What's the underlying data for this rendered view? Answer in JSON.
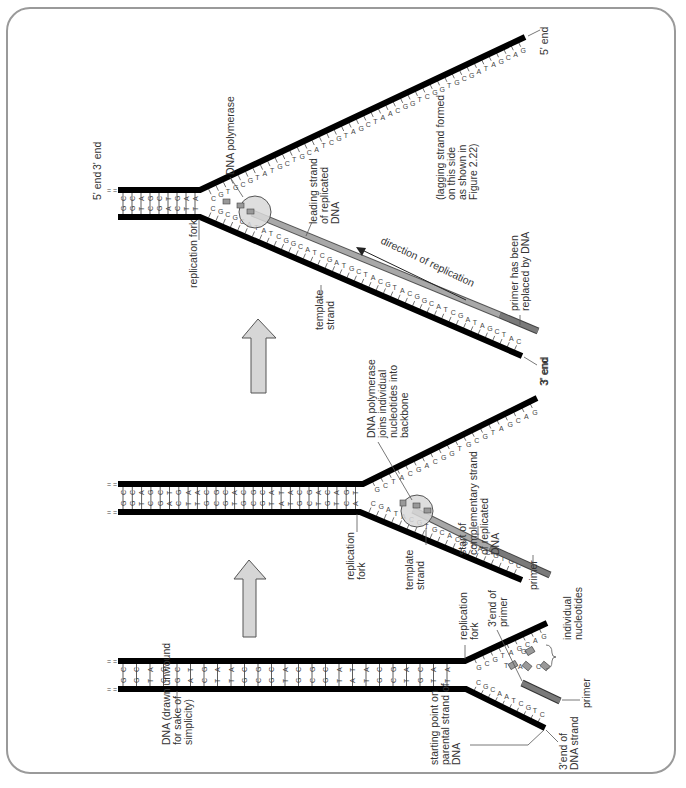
{
  "figure": {
    "orientation": "rotated-90-ccw",
    "colors": {
      "backbone": "#000000",
      "new_strand": "#a8a8a8",
      "primer": "#7a7a7a",
      "polymerase": "#d8d8d8",
      "step_arrow": "#d6d6d6",
      "frame": "#9a9a9a"
    },
    "panels": [
      {
        "id": "panel-1",
        "step": 1,
        "base_pairs": [
          "CG",
          "CG",
          "AT",
          "GC",
          "CG",
          "TA",
          "GC",
          "AT",
          "AT",
          "CG",
          "GC",
          "CG",
          "AT",
          "CG",
          "GC",
          "CG",
          "AT",
          "TA",
          "AT",
          "CG",
          "GC",
          "AT",
          "CG",
          "AT",
          "AT"
        ],
        "upper_arm_bases": [
          "G",
          "C",
          "G",
          "T",
          "A",
          "G",
          "C",
          "A",
          "G"
        ],
        "lower_arm_bases": [
          "C",
          "G",
          "C",
          "A",
          "A",
          "T",
          "C",
          "G",
          "T",
          "C"
        ],
        "free_nucleotides": [
          "T",
          "A",
          "G",
          "C"
        ],
        "labels": {
          "dna": "DNA (drawn unwound for sake of simplicity)",
          "starting_point": "starting point on parental strand of DNA",
          "fork": "replication fork",
          "primer_end": "3'end of primer",
          "nucleotides": "individual nucleotides",
          "primer": "primer",
          "strand_end": "3'end of DNA strand"
        }
      },
      {
        "id": "panel-2",
        "step": 2,
        "base_pairs": [
          "CG",
          "CG",
          "AT",
          "GC",
          "CG",
          "TA",
          "GC",
          "AT",
          "AT",
          "CG",
          "GC",
          "CG",
          "AT",
          "CG",
          "GC",
          "CG",
          "AT",
          "TA",
          "AT",
          "CG",
          "GC",
          "AT",
          "CG",
          "AT",
          "GC",
          "TA"
        ],
        "upper_arm_bases": [
          "G",
          "C",
          "T",
          "A",
          "C",
          "G",
          "A",
          "C",
          "G",
          "G",
          "T",
          "G",
          "C",
          "G",
          "T",
          "A",
          "G",
          "C",
          "A",
          "G"
        ],
        "lower_arm_bases": [
          "C",
          "G",
          "A",
          "T",
          "A",
          "C",
          "G",
          "T",
          "G",
          "C",
          "A",
          "C",
          "G",
          "T",
          "A",
          "C",
          "G",
          "T",
          "G",
          "C"
        ],
        "labels": {
          "polymerase": "DNA polymerase joins individual nucleotides into backbone",
          "fork": "replication fork",
          "template": "template strand",
          "new_strand": "start of complementary strand of replicated DNA",
          "primer": "primer",
          "end_3": "3' end"
        }
      },
      {
        "id": "panel-3",
        "step": 3,
        "base_pairs": [
          "CG",
          "CG",
          "AT",
          "GC",
          "CG",
          "TA",
          "GC",
          "AT",
          "AT"
        ],
        "upper_arm_bases": [
          "C",
          "G",
          "T",
          "G",
          "C",
          "G",
          "T",
          "A",
          "T",
          "G",
          "C",
          "T",
          "G",
          "C",
          "A",
          "T",
          "C",
          "G",
          "T",
          "A",
          "G",
          "C",
          "T",
          "A",
          "A",
          "C",
          "G",
          "G",
          "T",
          "C",
          "G",
          "G",
          "T",
          "G",
          "C",
          "G",
          "A",
          "T",
          "A",
          "G",
          "C",
          "A",
          "G"
        ],
        "lower_arm_bases": [
          "C",
          "G",
          "C",
          "G",
          "C",
          "A",
          "T",
          "A",
          "T",
          "C",
          "G",
          "G",
          "C",
          "A",
          "T",
          "C",
          "G",
          "A",
          "T",
          "G",
          "C",
          "T",
          "A",
          "C",
          "G",
          "T",
          "A",
          "C",
          "G",
          "G",
          "C",
          "A",
          "T",
          "C",
          "G",
          "A",
          "T",
          "A",
          "G",
          "C",
          "T",
          "A",
          "C"
        ],
        "labels": {
          "polymerase": "DNA polymerase",
          "end_5_top": "5' end",
          "end_3_top": "3' end",
          "end_5_left": "5' end",
          "fork": "replication fork",
          "leading": "leading strand of replicated DNA",
          "template": "template strand",
          "direction": "direction of replication",
          "primer_replaced": "primer has been replaced by DNA",
          "lagging": "(lagging strand formed on this side as shown in Figure 2.22)",
          "end_3_bottom": "3' end"
        }
      }
    ]
  }
}
